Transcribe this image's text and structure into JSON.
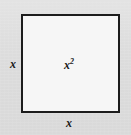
{
  "figure": {
    "type": "geometry-diagram",
    "shape": "square",
    "background_color": "#dedede",
    "interior_color": "#f6f6f6",
    "border_color": "#1c1c1c",
    "text_color": "#1a1a1a",
    "labels": {
      "left_side": "x",
      "bottom_side": "x",
      "interior_base": "x",
      "interior_exponent": "2"
    },
    "geometry": {
      "square_left": 21,
      "square_top": 14,
      "square_width": 99,
      "square_height": 99,
      "border_width": 2,
      "canvas_width": 131,
      "canvas_height": 135
    }
  }
}
